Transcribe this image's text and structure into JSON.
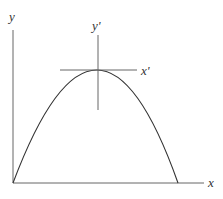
{
  "diagram": {
    "title": "",
    "labels": {
      "y_axis": "y",
      "x_axis": "x",
      "y_prime": "y'",
      "x_prime": "x'"
    },
    "colors": {
      "stroke": "#555555",
      "curve": "#333333",
      "background": "#ffffff"
    }
  }
}
